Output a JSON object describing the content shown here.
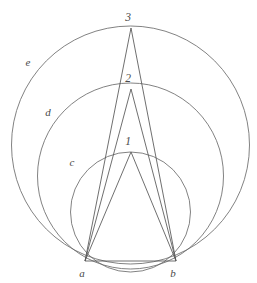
{
  "figure": {
    "background_color": "#ffffff",
    "stroke_color": "#6b6b6b",
    "label_color": "#4a4a4a",
    "width": 257,
    "height": 283
  },
  "labels": {
    "apex_1": "1",
    "apex_2": "2",
    "apex_3": "3",
    "base_a": "a",
    "base_b": "b",
    "circle_c": "c",
    "circle_d": "d",
    "circle_e": "e"
  },
  "chart_data": {
    "type": "diagram",
    "xlabel": "",
    "ylabel": "",
    "xlim": [
      0,
      257
    ],
    "ylim": [
      0,
      283
    ],
    "grid": false,
    "legend": "none",
    "points": [
      {
        "name": "a",
        "label": "a",
        "x": 85,
        "y": 261,
        "label_x": 82,
        "label_y": 277
      },
      {
        "name": "b",
        "label": "b",
        "x": 176,
        "y": 261,
        "label_x": 173,
        "label_y": 277
      },
      {
        "name": "1",
        "label": "1",
        "x": 131,
        "y": 152,
        "label_x": 128,
        "label_y": 145
      },
      {
        "name": "2",
        "label": "2",
        "x": 131,
        "y": 89,
        "label_x": 128,
        "label_y": 82
      },
      {
        "name": "3",
        "label": "3",
        "x": 131,
        "y": 28,
        "label_x": 128,
        "label_y": 21
      }
    ],
    "circles": [
      {
        "name": "c",
        "label": "c",
        "cx": 130.5,
        "cy": 212.0,
        "r": 60.0,
        "label_x": 72,
        "label_y": 166
      },
      {
        "name": "d",
        "label": "d",
        "cx": 130.5,
        "cy": 176.0,
        "r": 93.0,
        "label_x": 48,
        "label_y": 116
      },
      {
        "name": "e",
        "label": "e",
        "cx": 130.5,
        "cy": 145.0,
        "r": 119.0,
        "label_x": 28,
        "label_y": 66
      }
    ],
    "segments": [
      {
        "name": "base-ab",
        "from": "a",
        "to": "b",
        "x1": 85,
        "y1": 261,
        "x2": 176,
        "y2": 261
      },
      {
        "name": "a-to-1",
        "from": "a",
        "to": "1",
        "x1": 85,
        "y1": 261,
        "x2": 131,
        "y2": 152
      },
      {
        "name": "b-to-1",
        "from": "b",
        "to": "1",
        "x1": 176,
        "y1": 261,
        "x2": 131,
        "y2": 152
      },
      {
        "name": "a-to-2",
        "from": "a",
        "to": "2",
        "x1": 85,
        "y1": 261,
        "x2": 131,
        "y2": 89
      },
      {
        "name": "b-to-2",
        "from": "b",
        "to": "2",
        "x1": 176,
        "y1": 261,
        "x2": 131,
        "y2": 89
      },
      {
        "name": "a-to-3",
        "from": "a",
        "to": "3",
        "x1": 85,
        "y1": 261,
        "x2": 131,
        "y2": 28
      },
      {
        "name": "b-to-3",
        "from": "b",
        "to": "3",
        "x1": 176,
        "y1": 261,
        "x2": 131,
        "y2": 28
      }
    ]
  }
}
